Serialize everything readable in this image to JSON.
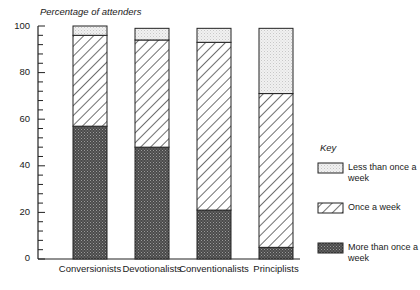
{
  "chart_data": {
    "type": "bar",
    "stacked": true,
    "title": "",
    "ylabel": "Percentage of attenders",
    "xlabel": "",
    "ylim": [
      0,
      100
    ],
    "yticks": [
      0,
      20,
      40,
      60,
      80,
      100
    ],
    "grid": false,
    "legend_title": "Key",
    "legend_position": "right",
    "categories": [
      "Conversionists",
      "Devotionalists",
      "Conventionalists",
      "Principlists"
    ],
    "series": [
      {
        "name": "More than once a week",
        "pattern": "dark-crosshatch",
        "values": [
          57,
          48,
          21,
          5
        ]
      },
      {
        "name": "Once a week",
        "pattern": "diagonal-hatch",
        "values": [
          39,
          46,
          72,
          66
        ]
      },
      {
        "name": "Less than once a week",
        "pattern": "light-stipple",
        "values": [
          4,
          5,
          6,
          28
        ]
      }
    ]
  },
  "labels": {
    "ytitle": "Percentage of attenders",
    "yticks": [
      "100",
      "80",
      "60",
      "40",
      "20",
      "0"
    ],
    "categories": [
      "Conversionists",
      "Devotionalists",
      "Conventionalists",
      "Principlists"
    ],
    "key_title": "Key",
    "key_items": [
      "Less than once a week",
      "Once a week",
      "More than once a week"
    ]
  }
}
